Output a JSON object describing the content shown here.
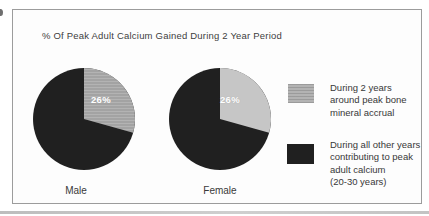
{
  "chart_data": {
    "type": "pie",
    "title": "% Of Peak Adult Calcium Gained During 2 Year Period",
    "legend_position": "right",
    "pies": [
      {
        "category": "Male",
        "data_label": "26%",
        "slices": [
          {
            "legend": "During 2 years around peak bone mineral accrual",
            "value": 26,
            "color": "#b3b3b3",
            "pattern": "horizontal-lines"
          },
          {
            "legend": "During all other years contributing to peak adult calcium (20-30 years)",
            "value": 74,
            "color": "#202020"
          }
        ]
      },
      {
        "category": "Female",
        "data_label": "26%",
        "slices": [
          {
            "legend": "During 2 years around peak bone mineral accrual",
            "value": 26,
            "color": "#c6c6c6",
            "pattern": "none"
          },
          {
            "legend": "During all other years contributing to peak adult calcium (20-30 years)",
            "value": 74,
            "color": "#202020"
          }
        ]
      }
    ],
    "legend": [
      {
        "swatch_color": "#b3b3b3",
        "swatch_pattern": "horizontal-lines",
        "label": "During 2 years around peak bone mineral accrual",
        "lines": [
          "During 2 years",
          "around peak bone",
          "mineral accrual"
        ]
      },
      {
        "swatch_color": "#202020",
        "swatch_pattern": "solid",
        "label": "During all other years contributing to peak adult calcium (20-30 years)",
        "lines": [
          "During all other years",
          "contributing to peak",
          "adult calcium",
          "(20-30 years)"
        ]
      }
    ],
    "colors": {
      "frame_border": "#9c9c9c",
      "dark_slice": "#202020",
      "male_light_slice": "#b3b3b3",
      "female_light_slice": "#c6c6c6",
      "on_slice_text": "#ffffff",
      "text": "#3e3e3e"
    }
  }
}
